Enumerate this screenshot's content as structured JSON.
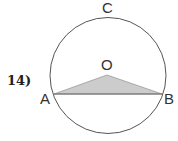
{
  "problem": {
    "number": "14)"
  },
  "diagram": {
    "labels": {
      "C": "C",
      "O": "O",
      "A": "A",
      "B": "B"
    },
    "circle": {
      "cx": 108,
      "cy": 75.5,
      "r": 58,
      "stroke": "#555555"
    },
    "triangle": {
      "points": "54,94 107,75 162,94",
      "fill": "#cccccc",
      "stroke": "#888888"
    },
    "chord": {
      "from": "A",
      "to": "B"
    }
  }
}
